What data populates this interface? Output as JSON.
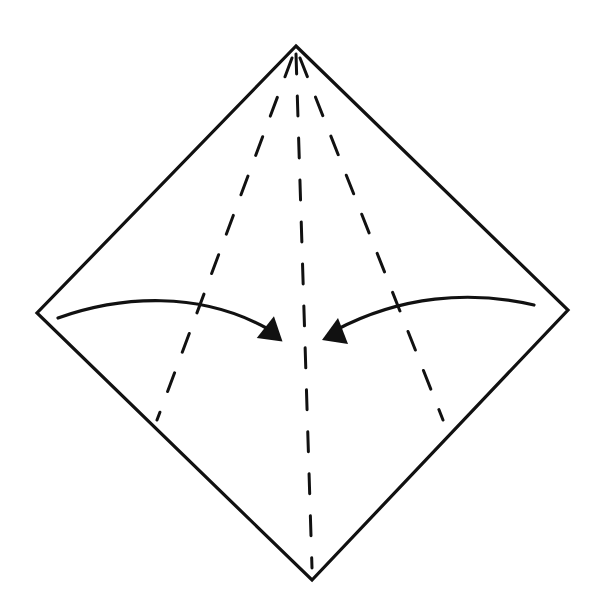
{
  "diagram": {
    "type": "origami-fold-step",
    "colors": {
      "background": "#ffffff",
      "stroke": "#111111"
    },
    "square": {
      "top": [
        296,
        46
      ],
      "right": [
        568,
        310
      ],
      "bottom": [
        312,
        580
      ],
      "left": [
        37,
        313
      ]
    },
    "crease_lines": [
      {
        "name": "center-valley-fold",
        "from": [
          296,
          52
        ],
        "to": [
          312,
          570
        ]
      },
      {
        "name": "left-valley-fold",
        "from": [
          294,
          54
        ],
        "to": [
          157,
          422
        ]
      },
      {
        "name": "right-valley-fold",
        "from": [
          298,
          54
        ],
        "to": [
          443,
          422
        ]
      }
    ],
    "arrows": [
      {
        "name": "left-fold-arrow",
        "direction": "right",
        "from": [
          58,
          318
        ],
        "to": [
          282,
          338
        ]
      },
      {
        "name": "right-fold-arrow",
        "direction": "left",
        "from": [
          535,
          305
        ],
        "to": [
          323,
          338
        ]
      }
    ]
  }
}
